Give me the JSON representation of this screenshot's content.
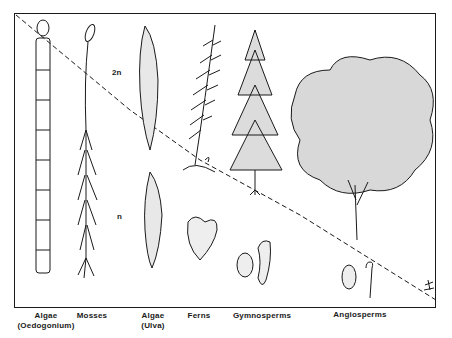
{
  "diagram": {
    "ploidy_labels": {
      "diploid": "2n",
      "haploid": "n"
    },
    "groups": [
      {
        "label": "Algae",
        "sublabel": "(Oedogonium)"
      },
      {
        "label": "Mosses",
        "sublabel": ""
      },
      {
        "label": "Algae",
        "sublabel": "(Ulva)"
      },
      {
        "label": "Ferns",
        "sublabel": ""
      },
      {
        "label": "Gymnosperms",
        "sublabel": ""
      },
      {
        "label": "Angiosperms",
        "sublabel": ""
      }
    ],
    "colors": {
      "ink": "#1a1a1a",
      "background": "#ffffff"
    }
  }
}
